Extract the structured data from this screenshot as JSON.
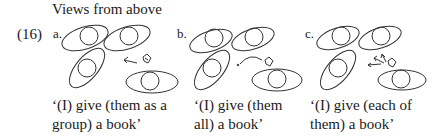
{
  "figure": {
    "title": "Views from above",
    "example_number": "(16)",
    "panels": [
      {
        "label": "a.",
        "caption_line1": "‘(I) give (them as a",
        "caption_line2": "group) a book’",
        "arrow_type": "single-straight"
      },
      {
        "label": "b.",
        "caption_line1": "‘(I) give (them",
        "caption_line2": "all) a book’",
        "arrow_type": "curved"
      },
      {
        "label": "c.",
        "caption_line1": "‘(I) give (each of",
        "caption_line2": "them) a book’",
        "arrow_type": "multiple-straight"
      }
    ]
  }
}
